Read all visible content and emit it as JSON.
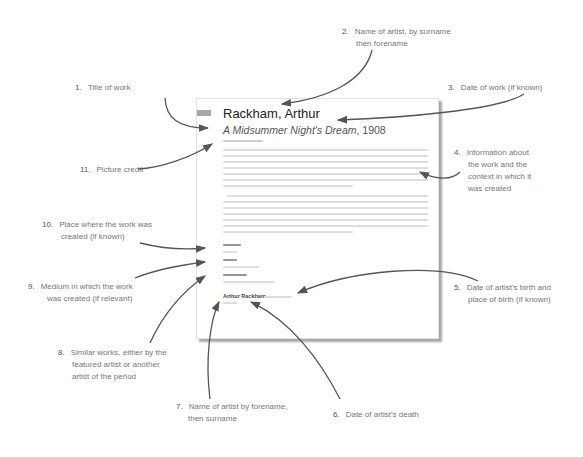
{
  "page": {
    "artist_heading": "Rackham, Arthur",
    "work_title": "A Midsummer Night's Dream",
    "work_date": ", 1908",
    "artist_signature": "Arthur Rackham"
  },
  "annotations": [
    {
      "number": "1.",
      "text": [
        "Title of work"
      ]
    },
    {
      "number": "2.",
      "text": [
        "Name of artist, by surname",
        "then forename"
      ]
    },
    {
      "number": "3.",
      "text": [
        "Date of work (if known)"
      ]
    },
    {
      "number": "4.",
      "text": [
        "Information about",
        "the work and the",
        "context in which it",
        "was created"
      ]
    },
    {
      "number": "5.",
      "text": [
        "Date of artist's birth and",
        "place of birth (if known)"
      ]
    },
    {
      "number": "6.",
      "text": [
        "Date of artist's death"
      ]
    },
    {
      "number": "7.",
      "text": [
        "Name of artist by forename,",
        "then surname"
      ]
    },
    {
      "number": "8.",
      "text": [
        "Similar works, either by the",
        "featured artist or another",
        "artist of the period"
      ]
    },
    {
      "number": "9.",
      "text": [
        "Medium in which the work",
        "was created (if relevant)"
      ]
    },
    {
      "number": "10.",
      "text": [
        "Place where the work was",
        "created (if known)"
      ]
    },
    {
      "number": "11.",
      "text": [
        "Picture credit"
      ]
    }
  ],
  "colors": {
    "arrow": "#555555",
    "label_text": "#777777",
    "page_border": "#e2e2e2"
  }
}
